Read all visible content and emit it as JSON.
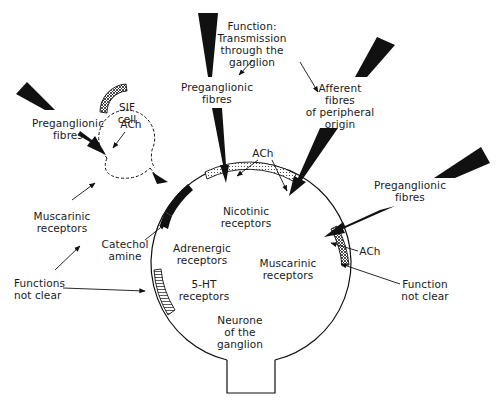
{
  "diagram": {
    "colors": {
      "ink": "#111111",
      "background": "#ffffff"
    },
    "cell": {
      "label": "Neurone\nof the\nganglion"
    },
    "sif_cell": {
      "label": "SIF\ncell"
    },
    "labels": {
      "function_transmission": "Function:\nTransmission\nthrough the\nganglion",
      "preganglionic_top": "Preganglionic\nfibres",
      "afferent": "Afferent\nfibres\nof peripheral\norigin",
      "preganglionic_left": "Preganglionic\nfibres",
      "ach_left": "ACh",
      "ach_top": "ACh",
      "preganglionic_right": "Preganglionic\nfibres",
      "ach_right": "ACh",
      "muscarinic_left": "Muscarinic\nreceptors",
      "catechol_amine": "Catechol\namine",
      "functions_not_clear": "Functions\nnot clear",
      "function_not_clear_right": "Function\nnot clear",
      "nicotinic": "Nicotinic\nreceptors",
      "adrenergic": "Adrenergic\nreceptors",
      "muscarinic_inner": "Muscarinic\nreceptors",
      "five_ht": "5-HT\nreceptors"
    },
    "icons": [
      "preganglionic-fibre-arrow-left",
      "preganglionic-fibre-arrow-top",
      "afferent-fibre-arrow",
      "preganglionic-fibre-arrow-right",
      "nicotinic-receptor-patch",
      "adrenergic-receptor-patch",
      "muscarinic-receptor-patch",
      "5ht-receptor-patch",
      "sif-receptor-patch"
    ]
  }
}
